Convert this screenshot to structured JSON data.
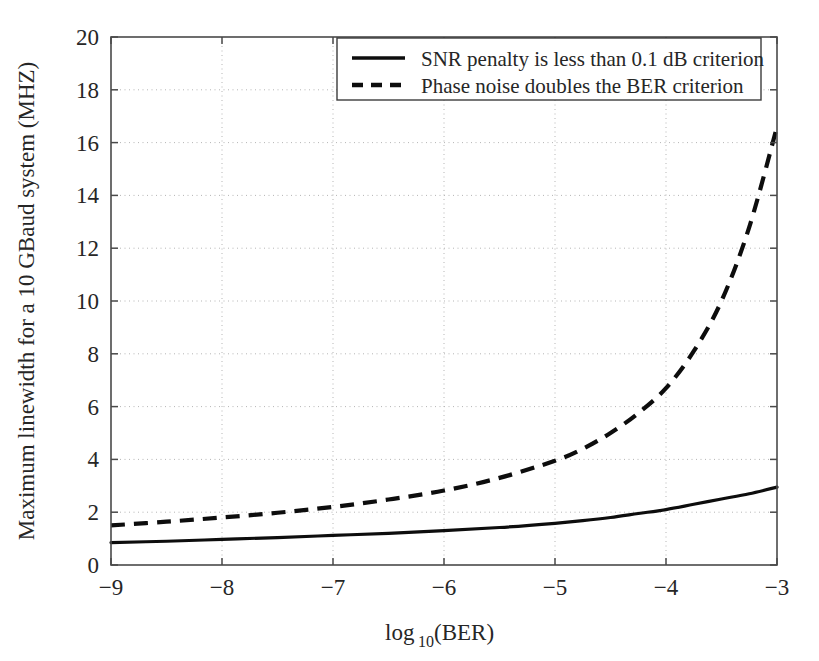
{
  "chart_data": {
    "type": "line",
    "title": "",
    "xlabel": "log10 (BER)",
    "xlabel_base": "log",
    "xlabel_sub": "10",
    "xlabel_rest": " (BER)",
    "ylabel": "Maximum linewidth for a 10 GBaud system (MHZ)",
    "xlim": [
      -9,
      -3
    ],
    "ylim": [
      0,
      20
    ],
    "grid": true,
    "legend_position": "top-center",
    "xticks": [
      -9,
      -8,
      -7,
      -6,
      -5,
      -4,
      -3
    ],
    "xtick_labels": [
      "−9",
      "−8",
      "−7",
      "−6",
      "−5",
      "−4",
      "−3"
    ],
    "yticks": [
      0,
      2,
      4,
      6,
      8,
      10,
      12,
      14,
      16,
      18,
      20
    ],
    "ytick_labels": [
      "0",
      "2",
      "4",
      "6",
      "8",
      "10",
      "12",
      "14",
      "16",
      "18",
      "20"
    ],
    "x": [
      -9,
      -8.5,
      -8,
      -7.5,
      -7,
      -6.5,
      -6,
      -5.5,
      -5,
      -4.75,
      -4.5,
      -4.25,
      -4,
      -3.75,
      -3.5,
      -3.25,
      -3
    ],
    "series": [
      {
        "name": "SNR penalty is less than 0.1 dB criterion",
        "style": "solid",
        "values": [
          0.85,
          0.9,
          0.97,
          1.04,
          1.12,
          1.2,
          1.3,
          1.42,
          1.58,
          1.68,
          1.8,
          1.95,
          2.1,
          2.3,
          2.5,
          2.7,
          2.95
        ]
      },
      {
        "name": "Phase noise doubles the BER criterion",
        "style": "dashed",
        "values": [
          1.5,
          1.64,
          1.8,
          1.98,
          2.2,
          2.48,
          2.82,
          3.3,
          3.95,
          4.4,
          5.0,
          5.75,
          6.7,
          8.1,
          10.0,
          12.8,
          16.6
        ]
      }
    ]
  },
  "legend": {
    "entries": [
      {
        "label": "SNR penalty is less than 0.1 dB criterion",
        "style": "solid"
      },
      {
        "label": "Phase noise doubles the BER criterion",
        "style": "dashed"
      }
    ]
  }
}
